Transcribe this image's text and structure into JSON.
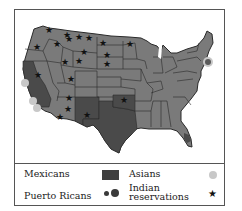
{
  "map": {
    "subject": "United States minority population distribution",
    "colors": {
      "state_fill": "#7a7a7a",
      "state_border": "#2a2a2a",
      "mexican_fill": "#4a4a4a",
      "asian_dot": "#c8c8c8",
      "puerto_rican_dot": "#3a3a3a",
      "star": "#111111"
    }
  },
  "legend": {
    "items": [
      {
        "label": "Mexicans",
        "symbol": "dark-square"
      },
      {
        "label": "Asians",
        "symbol": "light-circle"
      },
      {
        "label": "Puerto Ricans",
        "symbol": "dark-dots"
      },
      {
        "label_line1": "Indian",
        "label_line2": "reservations",
        "symbol": "star"
      }
    ]
  }
}
